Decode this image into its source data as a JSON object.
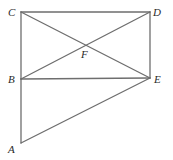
{
  "diagram": {
    "type": "geometry",
    "stroke_color": "#6e6e6e",
    "label_color": "#2a2a2a",
    "points": {
      "A": {
        "label": "A",
        "x": 21,
        "y": 143,
        "lx": 8,
        "ly": 153
      },
      "B": {
        "label": "B",
        "x": 21,
        "y": 79,
        "lx": 8,
        "ly": 83
      },
      "C": {
        "label": "C",
        "x": 21,
        "y": 12,
        "lx": 8,
        "ly": 16
      },
      "D": {
        "label": "D",
        "x": 150,
        "y": 12,
        "lx": 153,
        "ly": 16
      },
      "E": {
        "label": "E",
        "x": 150,
        "y": 78,
        "lx": 154,
        "ly": 83
      },
      "F": {
        "label": "F",
        "x": 86,
        "y": 45,
        "lx": 81,
        "ly": 58
      }
    },
    "segments": [
      {
        "from": "C",
        "to": "D"
      },
      {
        "from": "C",
        "to": "B"
      },
      {
        "from": "B",
        "to": "A"
      },
      {
        "from": "D",
        "to": "E"
      },
      {
        "from": "B",
        "to": "E"
      },
      {
        "from": "C",
        "to": "E"
      },
      {
        "from": "B",
        "to": "D"
      },
      {
        "from": "A",
        "to": "E"
      }
    ]
  }
}
